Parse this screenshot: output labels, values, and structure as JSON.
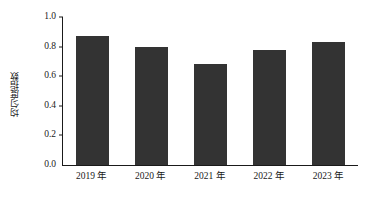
{
  "chart_data": {
    "type": "bar",
    "title": "",
    "subtitle": "",
    "xlabel": "",
    "ylabel": "均匀度指数",
    "categories": [
      "2019 年",
      "2020 年",
      "2021 年",
      "2022 年",
      "2023 年"
    ],
    "values": [
      0.87,
      0.8,
      0.68,
      0.78,
      0.83
    ],
    "ylim": [
      0.0,
      1.0
    ],
    "yticks": [
      "0.0",
      "0.2",
      "0.4",
      "0.6",
      "0.8",
      "1.0"
    ],
    "ytick_values": [
      0.0,
      0.2,
      0.4,
      0.6,
      0.8,
      1.0
    ],
    "grid": false,
    "legend": null,
    "legend_position": "none",
    "bar_color": "#333333",
    "axis_color": "#1a1a1a",
    "background_color": "#ffffff",
    "annotations": []
  }
}
